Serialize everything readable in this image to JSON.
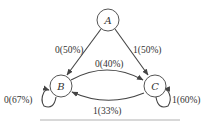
{
  "diagram": {
    "type": "state-transition",
    "nodes": [
      {
        "id": "A",
        "label": "A"
      },
      {
        "id": "B",
        "label": "B"
      },
      {
        "id": "C",
        "label": "C"
      }
    ],
    "edges": [
      {
        "from": "A",
        "to": "B",
        "label": "0(50%)"
      },
      {
        "from": "A",
        "to": "C",
        "label": "1(50%)"
      },
      {
        "from": "B",
        "to": "C",
        "label": "0(40%)"
      },
      {
        "from": "C",
        "to": "B",
        "label": "1(33%)"
      },
      {
        "from": "B",
        "to": "B",
        "label": "0(67%)"
      },
      {
        "from": "C",
        "to": "C",
        "label": "1(60%)"
      }
    ]
  },
  "colors": {
    "stroke": "#444444",
    "text": "#333333",
    "background": "#ffffff"
  }
}
